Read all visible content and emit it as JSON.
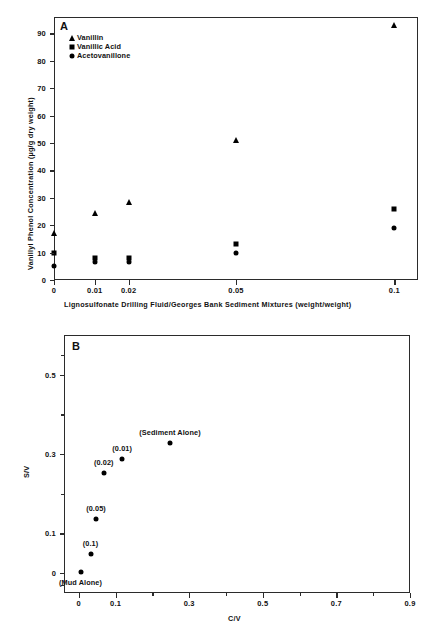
{
  "figure": {
    "panel_a_letter": "A",
    "panel_b_letter": "B"
  },
  "chart_data": [
    {
      "type": "scatter",
      "panel": "A",
      "title": "",
      "xlabel": "Lignosulfonate Drilling Fluid/Georges Bank Sediment Mixtures (weight/weight)",
      "ylabel": "Vanillyl Phenol Concentration (µg/g dry weight)",
      "xticks": [
        "0",
        "0.01",
        "0.02",
        "0.05",
        "0.1"
      ],
      "xtick_values": [
        0,
        0.01,
        0.02,
        0.05,
        0.1
      ],
      "yticks": [
        "0",
        "10",
        "20",
        "30",
        "40",
        "50",
        "60",
        "70",
        "80",
        "90"
      ],
      "ylim": [
        0,
        96
      ],
      "grid": false,
      "legend_position": "top-left",
      "series": [
        {
          "name": "Vanillin",
          "marker": "triangle",
          "x": [
            0,
            0.01,
            0.02,
            0.05,
            0.1
          ],
          "values": [
            17,
            24.5,
            28.5,
            51,
            93
          ]
        },
        {
          "name": "Vanillic Acid",
          "marker": "square",
          "x": [
            0,
            0.01,
            0.02,
            0.05,
            0.1
          ],
          "values": [
            10,
            8,
            8,
            13,
            26
          ]
        },
        {
          "name": "Acetovanillone",
          "marker": "circle",
          "x": [
            0,
            0.01,
            0.02,
            0.05,
            0.1
          ],
          "values": [
            5,
            6.5,
            6.5,
            10,
            19
          ]
        }
      ]
    },
    {
      "type": "scatter",
      "panel": "B",
      "title": "",
      "xlabel": "C/V",
      "ylabel": "S/V",
      "xticks": [
        "0",
        "0.1",
        "0.3",
        "0.5",
        "0.7",
        "0.9"
      ],
      "xtick_values": [
        0,
        0.1,
        0.3,
        0.5,
        0.7,
        0.9
      ],
      "xlim": [
        -0.04,
        0.9
      ],
      "yticks": [
        "0",
        "0.1",
        "0.3",
        "0.5"
      ],
      "ytick_values": [
        0,
        0.1,
        0.3,
        0.5
      ],
      "ylim": [
        -0.05,
        0.6
      ],
      "grid": false,
      "points": [
        {
          "label": "(Mud Alone)",
          "x": 0.005,
          "y": 0.003,
          "label_pos": "below"
        },
        {
          "label": "(0.1)",
          "x": 0.032,
          "y": 0.047,
          "label_pos": "above"
        },
        {
          "label": "(0.05)",
          "x": 0.047,
          "y": 0.137,
          "label_pos": "above"
        },
        {
          "label": "(0.02)",
          "x": 0.068,
          "y": 0.253,
          "label_pos": "above"
        },
        {
          "label": "(0.01)",
          "x": 0.118,
          "y": 0.287,
          "label_pos": "above"
        },
        {
          "label": "(Sediment Alone)",
          "x": 0.248,
          "y": 0.328,
          "label_pos": "above"
        }
      ]
    }
  ]
}
